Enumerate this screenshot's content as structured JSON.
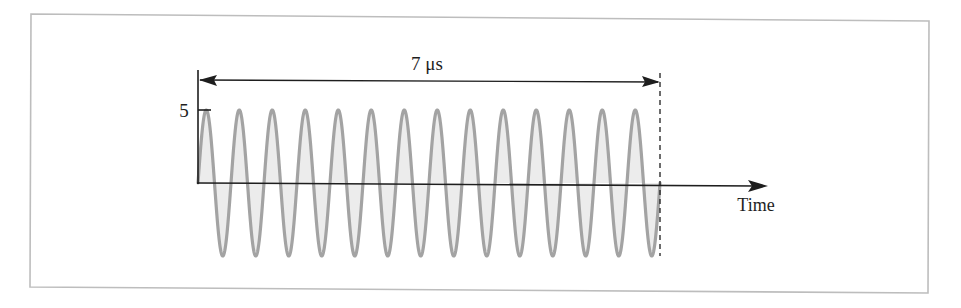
{
  "figure": {
    "duration_label": "7 μs",
    "amplitude_label": "5",
    "x_axis_label": "Time",
    "colors": {
      "wave_stroke": "#a3a3a3",
      "wave_fill": "#ececec",
      "axis": "#1e1e1e",
      "frame": "#bdbdbd"
    }
  },
  "chart_data": {
    "type": "line",
    "title": "",
    "xlabel": "Time",
    "ylabel": "",
    "cycles": 14,
    "duration_us": 7,
    "period_us": 0.5,
    "frequency_MHz": 2,
    "amplitude": 5,
    "y_ticks": [
      5
    ],
    "annotations": [
      "7 μs"
    ],
    "xlim": [
      0,
      7
    ],
    "ylim": [
      -5,
      5
    ],
    "grid": false,
    "legend": null
  },
  "layout": {
    "x0": 198,
    "x_end": 660,
    "y_zero": 183,
    "y_peak": 110,
    "y_trough": 256
  }
}
